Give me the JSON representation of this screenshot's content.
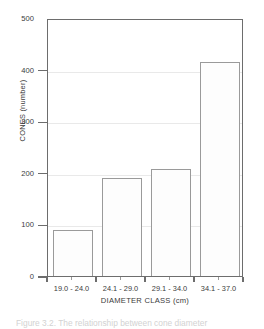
{
  "chart_data": {
    "type": "bar",
    "title": "",
    "categories": [
      "19.0 - 24.0",
      "24.1 - 29.0",
      "29.1 - 34.0",
      "34.1 - 37.0"
    ],
    "values": [
      90,
      190,
      208,
      415
    ],
    "xlabel": "DIAMETER CLASS (cm)",
    "ylabel": "CONES (number)",
    "ylim": [
      0,
      500
    ],
    "yticks": [
      0,
      100,
      200,
      300,
      400,
      500
    ],
    "ytick_labels": [
      "0",
      "100",
      "200",
      "300",
      "400",
      "500"
    ],
    "grid": true,
    "legend": null,
    "bar_fill": "#fdfdfd",
    "bar_edge": "#9a9a9a",
    "axis_color": "#6d6d6d",
    "grid_color": "#e9e9e9",
    "text_color": "#3b3b3b"
  },
  "caption": {
    "text": "Figure 3.2.   The relationship between cone diameter"
  }
}
